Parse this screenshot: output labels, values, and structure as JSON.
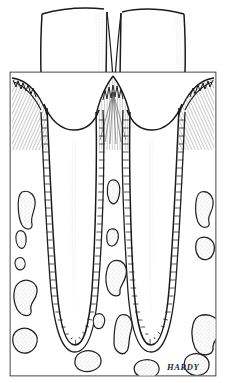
{
  "figure": {
    "medium": "pen-and-ink line drawing",
    "signature": "HARDY",
    "frame": {
      "x": 10,
      "y": 72,
      "width": 206,
      "height": 304,
      "stroke_color": "#1a1a1a"
    },
    "canvas": {
      "width": 226,
      "height": 383,
      "background": "#ffffff"
    },
    "ink_color": "#1a1a1a",
    "stipple_color": "#8a8a8a",
    "hatch_color": "#3a3a3a"
  },
  "structures": [
    {
      "id": "crown-left",
      "label": "Left tooth crown",
      "region": "enamel crown, extends above frame",
      "shading": "stippled mesial surface"
    },
    {
      "id": "crown-right",
      "label": "Right tooth crown",
      "region": "enamel crown, extends above frame",
      "shading": "stippled mesial surface"
    },
    {
      "id": "gingiva-left",
      "label": "Left marginal gingiva",
      "shading": "radiating fine hatch lines"
    },
    {
      "id": "gingiva-right",
      "label": "Right marginal gingiva",
      "shading": "radiating fine hatch lines"
    },
    {
      "id": "papilla-interdental",
      "label": "Interdental papilla",
      "shading": "sawtooth epithelial crest with radiating hatch"
    },
    {
      "id": "pdl-left",
      "label": "Left periodontal ligament",
      "shading": "ladder hatch band along root"
    },
    {
      "id": "pdl-right",
      "label": "Right periodontal ligament",
      "shading": "ladder hatch band along root"
    },
    {
      "id": "root-left",
      "label": "Left root with pulp canal",
      "shading": "faint stippled canal"
    },
    {
      "id": "root-right",
      "label": "Right root with pulp canal",
      "shading": "faint stippled canal"
    },
    {
      "id": "alveolar-bone",
      "label": "Alveolar bone with marrow spaces",
      "shading": "outlined stippled trabecular spaces"
    }
  ],
  "marrow_spaces": [
    {
      "cx": 26,
      "cy": 205,
      "rx": 9,
      "ry": 13,
      "seed": 11
    },
    {
      "cx": 22,
      "cy": 238,
      "rx": 5,
      "ry": 9,
      "seed": 23
    },
    {
      "cx": 21,
      "cy": 262,
      "rx": 4,
      "ry": 6,
      "seed": 31
    },
    {
      "cx": 27,
      "cy": 294,
      "rx": 11,
      "ry": 15,
      "seed": 43
    },
    {
      "cx": 28,
      "cy": 341,
      "rx": 10,
      "ry": 13,
      "seed": 57
    },
    {
      "cx": 114,
      "cy": 191,
      "rx": 7,
      "ry": 12,
      "seed": 67
    },
    {
      "cx": 113,
      "cy": 237,
      "rx": 6,
      "ry": 9,
      "seed": 79
    },
    {
      "cx": 117,
      "cy": 274,
      "rx": 11,
      "ry": 14,
      "seed": 83
    },
    {
      "cx": 99,
      "cy": 320,
      "rx": 6,
      "ry": 7,
      "seed": 97
    },
    {
      "cx": 123,
      "cy": 330,
      "rx": 10,
      "ry": 18,
      "seed": 101
    },
    {
      "cx": 88,
      "cy": 361,
      "rx": 13,
      "ry": 10,
      "seed": 103
    },
    {
      "cx": 146,
      "cy": 368,
      "rx": 12,
      "ry": 8,
      "seed": 107
    },
    {
      "cx": 205,
      "cy": 203,
      "rx": 8,
      "ry": 11,
      "seed": 109
    },
    {
      "cx": 206,
      "cy": 248,
      "rx": 9,
      "ry": 12,
      "seed": 113
    },
    {
      "cx": 208,
      "cy": 330,
      "rx": 13,
      "ry": 16,
      "seed": 127
    },
    {
      "cx": 196,
      "cy": 362,
      "rx": 9,
      "ry": 9,
      "seed": 131
    }
  ]
}
